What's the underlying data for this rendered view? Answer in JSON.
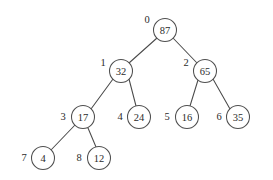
{
  "figure": {
    "kind": "binary-heap-tree",
    "background_color": "#ffffff",
    "stroke_color": "#4f4f4f",
    "text_color": "#2b2b2b",
    "node_radius": 11.5
  },
  "chart_data": {
    "type": "diagram",
    "title": "",
    "xlabel": "",
    "ylabel": "",
    "nodes": [
      {
        "index": "0",
        "value": "87",
        "cx": 165,
        "cy": 30,
        "index_x": 147,
        "index_y": 19
      },
      {
        "index": "1",
        "value": "32",
        "cx": 121,
        "cy": 71,
        "index_x": 103,
        "index_y": 62
      },
      {
        "index": "2",
        "value": "65",
        "cx": 205,
        "cy": 71,
        "index_x": 186,
        "index_y": 62
      },
      {
        "index": "3",
        "value": "17",
        "cx": 83,
        "cy": 117,
        "index_x": 63,
        "index_y": 116
      },
      {
        "index": "4",
        "value": "24",
        "cx": 139,
        "cy": 117,
        "index_x": 120,
        "index_y": 116
      },
      {
        "index": "5",
        "value": "16",
        "cx": 187,
        "cy": 117,
        "index_x": 167,
        "index_y": 116
      },
      {
        "index": "6",
        "value": "35",
        "cx": 238,
        "cy": 117,
        "index_x": 219,
        "index_y": 116
      },
      {
        "index": "7",
        "value": "4",
        "cx": 43,
        "cy": 158,
        "index_x": 24,
        "index_y": 157
      },
      {
        "index": "8",
        "value": "12",
        "cx": 99,
        "cy": 158,
        "index_x": 79,
        "index_y": 157
      }
    ],
    "edges": [
      {
        "from": "0",
        "to": "1",
        "x1": 157,
        "y1": 38,
        "x2": 129,
        "y2": 63
      },
      {
        "from": "0",
        "to": "2",
        "x1": 173,
        "y1": 38,
        "x2": 197,
        "y2": 63
      },
      {
        "from": "1",
        "to": "3",
        "x1": 113,
        "y1": 79,
        "x2": 91,
        "y2": 109
      },
      {
        "from": "1",
        "to": "4",
        "x1": 129,
        "y1": 79,
        "x2": 136,
        "y2": 106
      },
      {
        "from": "2",
        "to": "5",
        "x1": 198,
        "y1": 80,
        "x2": 190,
        "y2": 106
      },
      {
        "from": "2",
        "to": "6",
        "x1": 213,
        "y1": 79,
        "x2": 230,
        "y2": 109
      },
      {
        "from": "3",
        "to": "7",
        "x1": 75,
        "y1": 125,
        "x2": 51,
        "y2": 150
      },
      {
        "from": "3",
        "to": "8",
        "x1": 88,
        "y1": 128,
        "x2": 96,
        "y2": 147
      }
    ],
    "values_in_level_order": [
      "87",
      "32",
      "65",
      "17",
      "24",
      "16",
      "35",
      "4",
      "12"
    ],
    "indices_in_level_order": [
      "0",
      "1",
      "2",
      "3",
      "4",
      "5",
      "6",
      "7",
      "8"
    ]
  }
}
